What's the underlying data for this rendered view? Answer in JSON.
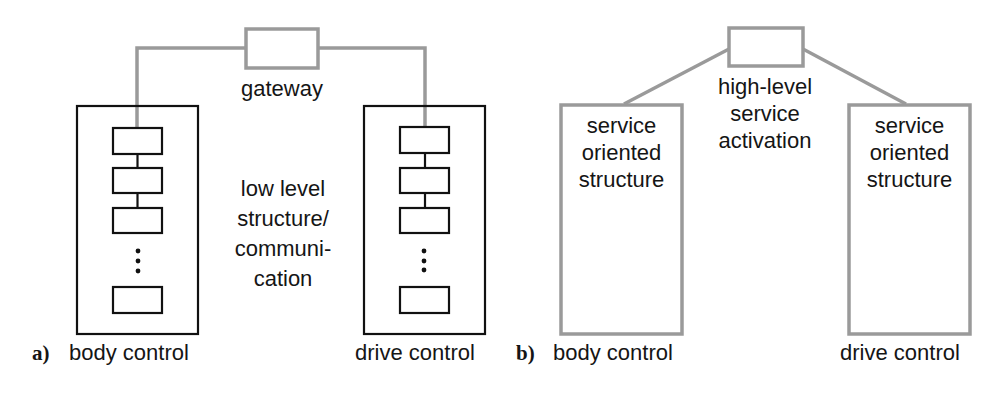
{
  "colors": {
    "black_stroke": "#111111",
    "gray_stroke": "#9a9a9a",
    "text": "#151515",
    "background": "#ffffff"
  },
  "panel_a": {
    "tag": "a)",
    "gateway_label": "gateway",
    "center_label_lines": [
      "low level",
      "structure/",
      "communi-",
      "cation"
    ],
    "left_unit_label": "body control",
    "right_unit_label": "drive control",
    "ellipsis_icon": "vertical-ellipsis"
  },
  "panel_b": {
    "tag": "b)",
    "center_label_lines": [
      "high-level",
      "service",
      "activation"
    ],
    "left_box_label_lines": [
      "service",
      "oriented",
      "structure"
    ],
    "right_box_label_lines": [
      "service",
      "oriented",
      "structure"
    ],
    "left_unit_label": "body control",
    "right_unit_label": "drive control"
  }
}
